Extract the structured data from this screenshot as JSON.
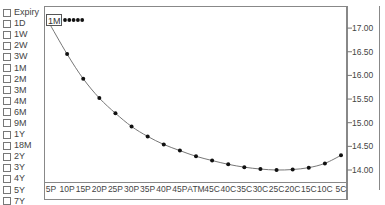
{
  "legend": {
    "items": [
      "Expiry",
      "1D",
      "1W",
      "2W",
      "3W",
      "1M",
      "2M",
      "3M",
      "4M",
      "6M",
      "9M",
      "1Y",
      "18M",
      "2Y",
      "3Y",
      "4Y",
      "5Y",
      "7Y",
      "10Y"
    ]
  },
  "series_tag": "1M",
  "colors": {
    "line": "#777777",
    "marker": "#111111",
    "frame": "#888888",
    "text": "#444444"
  },
  "chart_data": {
    "type": "line",
    "title": "",
    "xlabel": "",
    "ylabel": "",
    "categories": [
      "5P",
      "10P",
      "15P",
      "20P",
      "25P",
      "30P",
      "35P",
      "40P",
      "45P",
      "ATM",
      "45C",
      "40C",
      "35C",
      "30C",
      "25C",
      "20C",
      "15C",
      "10C",
      "5C"
    ],
    "series": [
      {
        "name": "1M",
        "values": [
          17.15,
          16.45,
          15.93,
          15.52,
          15.2,
          14.92,
          14.71,
          14.54,
          14.41,
          14.29,
          14.2,
          14.12,
          14.06,
          14.02,
          14.0,
          14.01,
          14.05,
          14.14,
          14.31
        ]
      }
    ],
    "yticks": [
      "14.00",
      "14.50",
      "15.00",
      "15.50",
      "16.00",
      "16.50",
      "17.00"
    ],
    "ylim": [
      13.7,
      17.3
    ],
    "y_axis_position": "right",
    "grid": false,
    "legend_position": "left"
  }
}
